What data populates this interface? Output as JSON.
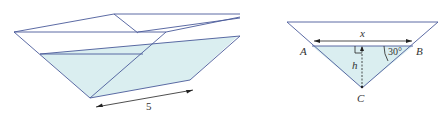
{
  "figure_left": {
    "description": "Trough (triangular prism) partially filled with water",
    "length_label": "5"
  },
  "figure_right": {
    "description": "Triangular cross-section of trough",
    "width_label": "x",
    "height_label": "h",
    "angle_label": "30°",
    "vertex_a": "A",
    "vertex_b": "B",
    "vertex_c": "C"
  },
  "colors": {
    "edge": "#4a5a9a",
    "water": "#daeef0",
    "text": "#333333"
  }
}
